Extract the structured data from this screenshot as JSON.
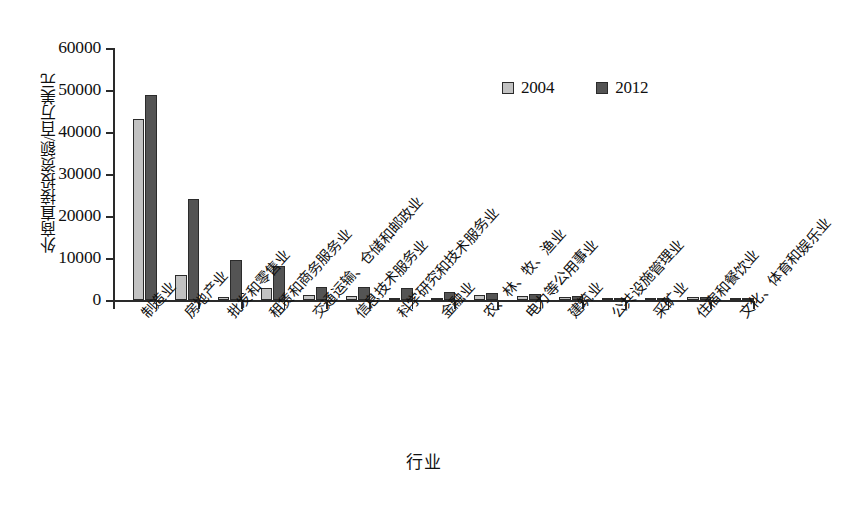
{
  "chart_data": {
    "type": "bar",
    "title": "",
    "xlabel": "行业",
    "ylabel": "外商直接投资额/百万美元",
    "ylim": [
      0,
      60000
    ],
    "ytick_labels": [
      "0",
      "10000",
      "20000",
      "30000",
      "40000",
      "50000",
      "60000"
    ],
    "ytick_values": [
      0,
      10000,
      20000,
      30000,
      40000,
      50000,
      60000
    ],
    "grid": false,
    "legend_position": "upper-right-inside",
    "categories": [
      "制造业",
      "房地产业",
      "批发和零售业",
      "租赁和商务服务业",
      "交通运输、仓储和邮政业",
      "信息技术服务业",
      "科学研究和技术服务业",
      "金融业",
      "农、林、牧、渔业",
      "电力等公用事业",
      "建筑业",
      "公共设施管理业",
      "采矿业",
      "住宿和餐饮业",
      "文化、体育和娱乐业"
    ],
    "series": [
      {
        "name": "2004",
        "color": "#c2c2c2",
        "values": [
          43000,
          6000,
          700,
          2800,
          1300,
          900,
          300,
          200,
          1100,
          1000,
          700,
          200,
          200,
          700,
          150
        ]
      },
      {
        "name": "2012",
        "color": "#545454",
        "values": [
          48800,
          24000,
          9500,
          8200,
          3200,
          3000,
          2800,
          1900,
          1700,
          1500,
          1000,
          450,
          500,
          700,
          400
        ]
      }
    ]
  },
  "legend": {
    "items": [
      {
        "label": "2004",
        "color": "#c2c2c2"
      },
      {
        "label": "2012",
        "color": "#545454"
      }
    ]
  },
  "axes": {
    "y_title": "外商直接投资额/百万美元",
    "x_title": "行业"
  }
}
